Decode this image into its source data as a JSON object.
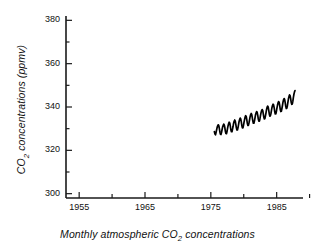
{
  "chart_data": {
    "type": "line",
    "title": "",
    "xlabel": "Monthly atmospheric CO2 concentrations",
    "xlabel_parts": {
      "pre": "Monthly atmospheric CO",
      "sub": "2",
      "post": " concentrations"
    },
    "ylabel": "CO2 concentrations (ppmv)",
    "ylabel_parts": {
      "pre": "CO",
      "sub": "2",
      "post": " concentrations (ppmv)"
    },
    "xlim": [
      1953.0,
      1989.0
    ],
    "ylim": [
      298.0,
      382.0
    ],
    "xticks": [
      1955,
      1960,
      1965,
      1970,
      1975,
      1980,
      1985,
      1990
    ],
    "xtick_labels": [
      "1955",
      "",
      "1965",
      "",
      "1975",
      "",
      "1985",
      ""
    ],
    "yticks": [
      300,
      310,
      320,
      330,
      340,
      350,
      360,
      370,
      380
    ],
    "ytick_labels": [
      "300",
      "",
      "320",
      "",
      "340",
      "",
      "360",
      "",
      "380"
    ],
    "grid": false,
    "legend": null,
    "series_name": "Monthly atmospheric CO2",
    "line_color": "#000000",
    "axis_color": "#1a1a1a",
    "background": "#ffffff",
    "x": [
      1975.54,
      1975.63,
      1975.71,
      1975.79,
      1975.88,
      1975.96,
      1976.04,
      1976.13,
      1976.21,
      1976.29,
      1976.38,
      1976.46,
      1976.54,
      1976.63,
      1976.71,
      1976.79,
      1976.88,
      1976.96,
      1977.04,
      1977.13,
      1977.21,
      1977.29,
      1977.38,
      1977.46,
      1977.54,
      1977.63,
      1977.71,
      1977.79,
      1977.88,
      1977.96,
      1978.04,
      1978.13,
      1978.21,
      1978.29,
      1978.38,
      1978.46,
      1978.54,
      1978.63,
      1978.71,
      1978.79,
      1978.88,
      1978.96,
      1979.04,
      1979.13,
      1979.21,
      1979.29,
      1979.38,
      1979.46,
      1979.54,
      1979.63,
      1979.71,
      1979.79,
      1979.88,
      1979.96,
      1980.04,
      1980.13,
      1980.21,
      1980.29,
      1980.38,
      1980.46,
      1980.54,
      1980.63,
      1980.71,
      1980.79,
      1980.88,
      1980.96,
      1981.04,
      1981.13,
      1981.21,
      1981.29,
      1981.38,
      1981.46,
      1981.54,
      1981.63,
      1981.71,
      1981.79,
      1981.88,
      1981.96,
      1982.04,
      1982.13,
      1982.21,
      1982.29,
      1982.38,
      1982.46,
      1982.54,
      1982.63,
      1982.71,
      1982.79,
      1982.88,
      1982.96,
      1983.04,
      1983.13,
      1983.21,
      1983.29,
      1983.38,
      1983.46,
      1983.54,
      1983.63,
      1983.71,
      1983.79,
      1983.88,
      1983.96,
      1984.04,
      1984.13,
      1984.21,
      1984.29,
      1984.38,
      1984.46,
      1984.54,
      1984.63,
      1984.71,
      1984.79,
      1984.88,
      1984.96,
      1985.04,
      1985.13,
      1985.21,
      1985.29,
      1985.38,
      1985.46,
      1985.54,
      1985.63,
      1985.71,
      1985.79,
      1985.88,
      1985.96,
      1986.04,
      1986.13,
      1986.21,
      1986.29,
      1986.38,
      1986.46,
      1986.54,
      1986.63,
      1986.71,
      1986.79,
      1986.88,
      1986.96,
      1987.04,
      1987.13,
      1987.21,
      1987.29,
      1987.38,
      1987.46,
      1987.54,
      1987.63,
      1987.71,
      1987.79
    ],
    "y": [
      328.6,
      327.5,
      327.2,
      328.2,
      329.5,
      330.6,
      331.3,
      331.8,
      331.4,
      330.1,
      328.4,
      327.4,
      327.3,
      328.3,
      329.6,
      330.8,
      331.5,
      332.1,
      331.7,
      330.4,
      328.8,
      327.8,
      327.7,
      328.7,
      330.1,
      331.5,
      332.4,
      333.0,
      332.5,
      331.2,
      329.5,
      328.6,
      328.6,
      329.7,
      331.1,
      332.5,
      333.4,
      334.0,
      333.5,
      332.1,
      330.4,
      329.4,
      329.4,
      330.5,
      331.9,
      333.3,
      334.3,
      334.9,
      334.5,
      333.1,
      331.4,
      330.4,
      330.4,
      331.5,
      332.9,
      334.3,
      335.4,
      336.0,
      335.6,
      334.2,
      332.5,
      331.5,
      331.5,
      332.6,
      334.0,
      335.4,
      336.4,
      337.0,
      336.6,
      335.2,
      333.5,
      332.5,
      332.5,
      333.6,
      335.0,
      336.4,
      337.3,
      337.9,
      337.5,
      336.1,
      334.4,
      333.5,
      333.5,
      334.6,
      336.0,
      337.4,
      338.3,
      338.8,
      338.4,
      337.0,
      335.4,
      334.5,
      334.6,
      335.8,
      337.3,
      338.8,
      339.8,
      340.4,
      340.0,
      338.6,
      336.8,
      335.8,
      335.9,
      337.0,
      338.4,
      339.8,
      340.8,
      341.3,
      340.9,
      339.5,
      337.8,
      336.8,
      336.9,
      338.0,
      339.5,
      340.9,
      341.9,
      342.5,
      342.1,
      340.7,
      338.9,
      337.9,
      338.0,
      339.2,
      340.7,
      342.2,
      343.3,
      343.9,
      343.5,
      342.1,
      340.3,
      339.3,
      339.4,
      340.6,
      342.2,
      343.8,
      344.9,
      345.6,
      345.2,
      343.8,
      342.1,
      341.2,
      341.4,
      342.7,
      344.4,
      346.0,
      347.0,
      347.6
    ]
  }
}
